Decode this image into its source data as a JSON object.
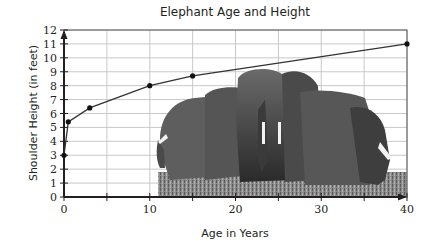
{
  "chart_data": {
    "type": "line",
    "title": "Elephant Age and Height",
    "xlabel": "Age in Years",
    "ylabel": "Shoulder Height (in feet)",
    "x": [
      0,
      0.5,
      3,
      10,
      15,
      40
    ],
    "series": [
      {
        "name": "Shoulder Height",
        "values": [
          3,
          5.4,
          6.4,
          8.0,
          8.7,
          11
        ]
      }
    ],
    "xlim": [
      0,
      40
    ],
    "ylim": [
      0,
      12
    ],
    "x_ticks": [
      0,
      10,
      20,
      30,
      40
    ],
    "x_minor_ticks": [
      5,
      15,
      25,
      35
    ],
    "y_ticks": [
      0,
      1,
      2,
      3,
      4,
      5,
      6,
      7,
      8,
      9,
      10,
      11,
      12
    ],
    "grid": true,
    "legend": "none",
    "background_image": "photo of a herd of elephants standing on grass"
  }
}
